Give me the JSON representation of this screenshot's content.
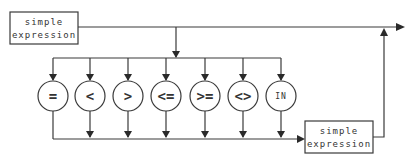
{
  "diagram": {
    "left_box": {
      "line1": "simple",
      "line2": "expression"
    },
    "right_box": {
      "line1": "simple",
      "line2": "expression"
    },
    "operators": [
      {
        "label": "=",
        "name": "equals"
      },
      {
        "label": "<",
        "name": "less-than"
      },
      {
        "label": ">",
        "name": "greater-than"
      },
      {
        "label": "<=",
        "name": "less-or-equal"
      },
      {
        "label": ">=",
        "name": "greater-or-equal"
      },
      {
        "label": "<>",
        "name": "not-equal"
      },
      {
        "label": "IN",
        "name": "in"
      }
    ],
    "colors": {
      "stroke": "#3a3a3a",
      "text": "#333333",
      "background": "#ffffff"
    }
  }
}
